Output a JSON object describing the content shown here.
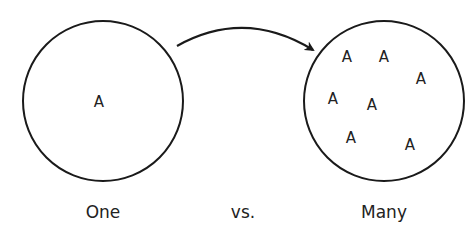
{
  "diagram": {
    "left": {
      "label": "One",
      "items": [
        {
          "text": "A",
          "x": 99,
          "y": 107
        }
      ]
    },
    "right": {
      "label": "Many",
      "items": [
        {
          "text": "A",
          "x": 347,
          "y": 62
        },
        {
          "text": "A",
          "x": 384,
          "y": 62
        },
        {
          "text": "A",
          "x": 421,
          "y": 84
        },
        {
          "text": "A",
          "x": 333,
          "y": 104
        },
        {
          "text": "A",
          "x": 372,
          "y": 110
        },
        {
          "text": "A",
          "x": 351,
          "y": 143
        },
        {
          "text": "A",
          "x": 410,
          "y": 150
        }
      ]
    },
    "middle_label": "vs.",
    "colors": {
      "stroke": "#1a1a1a",
      "text": "#222222"
    }
  }
}
